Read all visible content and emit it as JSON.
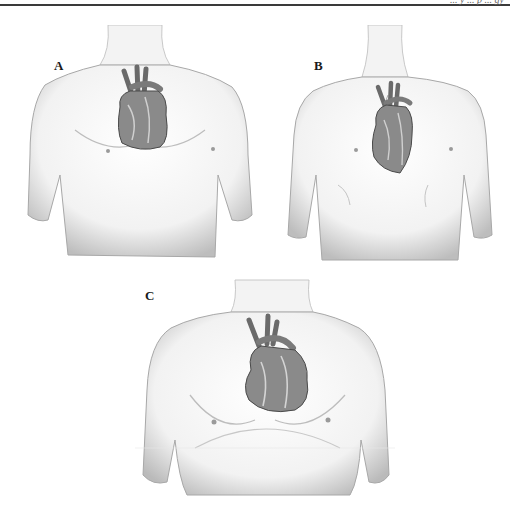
{
  "header": {
    "running_head_partial": "... y ... p ... gy"
  },
  "figure": {
    "panels": [
      {
        "label": "A",
        "description": "Average build torso with heart positioned obliquely in chest"
      },
      {
        "label": "B",
        "description": "Slender build torso with heart more vertical and lower"
      },
      {
        "label": "C",
        "description": "Broad/heavy build torso with heart more horizontal"
      }
    ]
  },
  "colors": {
    "skin_shade": "#c8c8c8",
    "heart_dark": "#5a5a5a",
    "heart_mid": "#8a8a8a",
    "rule": "#3a3a3a"
  }
}
